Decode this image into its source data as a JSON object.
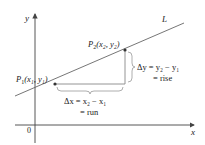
{
  "diagram": {
    "type": "slope-of-line",
    "axes": {
      "x_label": "x",
      "y_label": "y",
      "origin_label": "0"
    },
    "line": {
      "label": "L"
    },
    "points": [
      {
        "id": "P1",
        "name": "P",
        "sub": "1",
        "coords": "(x₁, y₁)"
      },
      {
        "id": "P2",
        "name": "P",
        "sub": "2",
        "coords": "(x₂, y₂)"
      }
    ],
    "run": {
      "line1": "Δx = x₂ − x₁",
      "line2": "= run"
    },
    "rise": {
      "line1": "Δy = y₂ − y₁",
      "line2": "= rise"
    },
    "colors": {
      "axis": "#444444",
      "line": "#666666",
      "triangle": "#888888",
      "point": "#333333",
      "text": "#222222"
    }
  }
}
